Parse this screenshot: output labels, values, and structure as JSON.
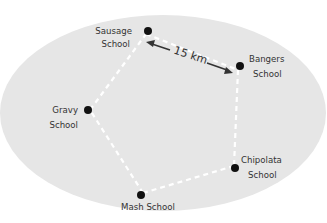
{
  "diagram": {
    "background_color": "#e6e6e6",
    "route_color": "#ffffff",
    "dot_color": "#111111",
    "schools": [
      {
        "id": "sausage",
        "line1": "Sausage",
        "line2": "School"
      },
      {
        "id": "bangers",
        "line1": "Bangers",
        "line2": "School"
      },
      {
        "id": "chipolata",
        "line1": "Chipolata",
        "line2": "School"
      },
      {
        "id": "mash",
        "line1": "Mash School",
        "line2": ""
      },
      {
        "id": "gravy",
        "line1": "Gravy",
        "line2": "School"
      }
    ],
    "route_order": [
      "sausage",
      "bangers",
      "chipolata",
      "mash",
      "gravy"
    ],
    "distance_label": "15 km",
    "distance_between": [
      "sausage",
      "bangers"
    ]
  }
}
